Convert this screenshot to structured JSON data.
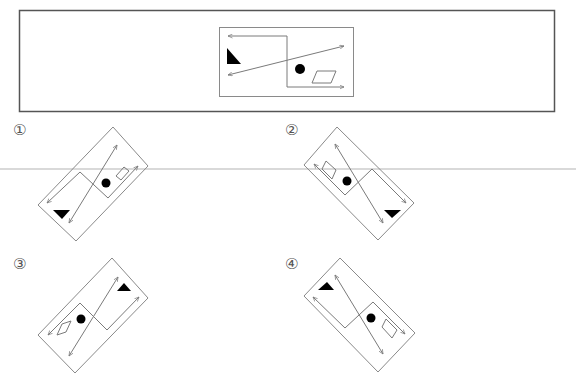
{
  "question": {
    "reference_figure": "original-rectangle-figure",
    "option_labels": [
      "①",
      "②",
      "③",
      "④"
    ]
  },
  "colors": {
    "frame": "#555555",
    "line": "#7a7a7a",
    "fill": "#000000",
    "separator": "#d9d9d9"
  },
  "options": [
    {
      "id": 1,
      "label": "①",
      "triangle_pointing": "down",
      "triangle_corner": "bottom-left"
    },
    {
      "id": 2,
      "label": "②",
      "triangle_pointing": "down",
      "triangle_corner": "bottom-right"
    },
    {
      "id": 3,
      "label": "③",
      "triangle_pointing": "up",
      "triangle_corner": "top-right"
    },
    {
      "id": 4,
      "label": "④",
      "triangle_pointing": "up",
      "triangle_corner": "top-left"
    }
  ]
}
